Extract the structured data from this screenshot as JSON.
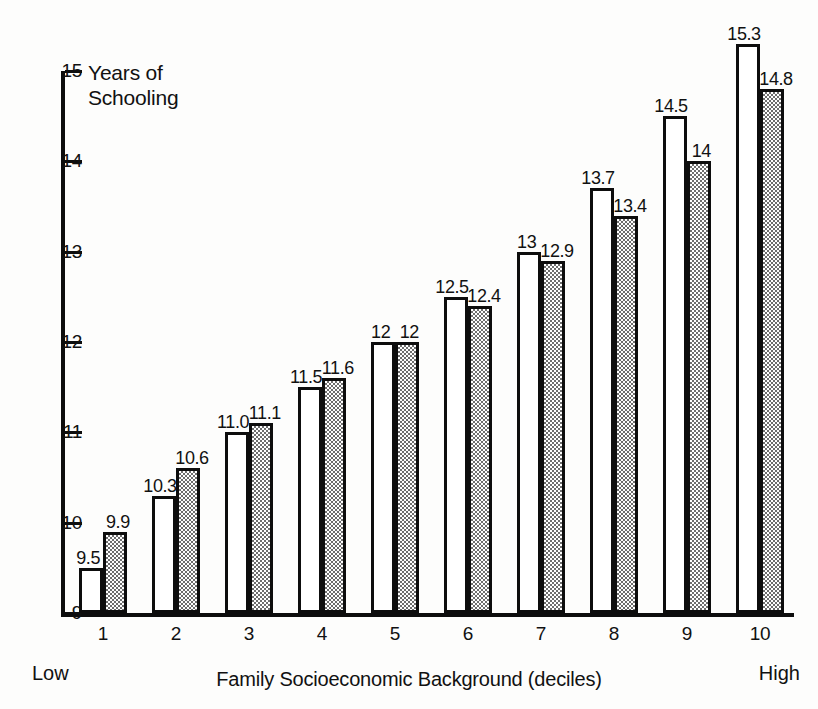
{
  "chart_data": {
    "type": "bar",
    "title": "Years of\nSchooling",
    "xlabel": "Family Socioeconomic Background (deciles)",
    "ylabel": "Years of Schooling",
    "ylim": [
      9,
      15
    ],
    "yticks": [
      9,
      10,
      11,
      12,
      13,
      14,
      15
    ],
    "ytick_labels": [
      "9",
      "10",
      "11",
      "12",
      "13",
      "14",
      "15"
    ],
    "grid": false,
    "legend": null,
    "categories": [
      "1",
      "2",
      "3",
      "4",
      "5",
      "6",
      "7",
      "8",
      "9",
      "10"
    ],
    "axis_endpoint_labels": {
      "left": "Low",
      "right": "High"
    },
    "series": [
      {
        "name": "series-1",
        "style": "white",
        "values": [
          9.5,
          10.3,
          11.0,
          11.5,
          12.0,
          12.5,
          13.0,
          13.7,
          14.5,
          15.3
        ],
        "labels": [
          "9.5",
          "10.3",
          "11.0",
          "11.5",
          "12",
          "12.5",
          "13",
          "13.7",
          "14.5",
          "15.3"
        ]
      },
      {
        "name": "series-2",
        "style": "shaded",
        "values": [
          9.9,
          10.6,
          11.1,
          11.6,
          12.0,
          12.4,
          12.9,
          13.4,
          14.0,
          14.8
        ],
        "labels": [
          "9.9",
          "10.6",
          "11.1",
          "11.6",
          "12",
          "12.4",
          "12.9",
          "13.4",
          "14",
          "14.8"
        ]
      }
    ]
  },
  "colors": {
    "ink": "#0d0d0d",
    "background": "#fdfdfc",
    "bar_plain_fill": "#ffffff",
    "bar_shaded_fill": "#6e6e6e"
  }
}
